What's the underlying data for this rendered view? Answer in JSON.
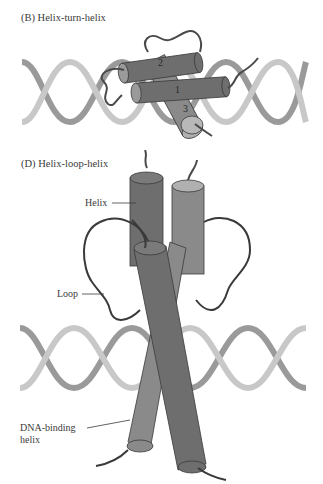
{
  "panels": [
    {
      "id": "B",
      "title": "(B) Helix-turn-helix",
      "helix_numbers": [
        "1",
        "2",
        "3"
      ]
    },
    {
      "id": "D",
      "title": "(D) Helix-loop-helix",
      "labels": {
        "helix": "Helix",
        "loop": "Loop",
        "dna_binding_line1": "DNA-binding",
        "dna_binding_line2": "helix"
      }
    }
  ],
  "colors": {
    "background": "#ffffff",
    "helix_dark": "#6e6e6e",
    "helix_mid": "#8a8a8a",
    "helix_light": "#a8a8a8",
    "dna_light": "#c8c8c8",
    "dna_dark": "#9a9a9a",
    "outline": "#3a3a3a",
    "text": "#3a3a3a"
  }
}
